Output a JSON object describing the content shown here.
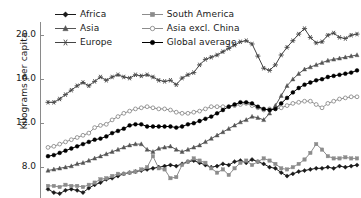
{
  "chart_data": {
    "type": "line",
    "title": "",
    "subtitle": "",
    "xlabel": "",
    "ylabel": "Kilograms per capita",
    "ylim": [
      5.2,
      21.2
    ],
    "yticks": [
      8.0,
      12.0,
      16.0,
      20.0
    ],
    "ytick_labels": [
      "8.0",
      "12.0",
      "16.0",
      "20.0"
    ],
    "grid": false,
    "legend_position": "top-left",
    "legend_columns": 2,
    "x": [
      1,
      2,
      3,
      4,
      5,
      6,
      7,
      8,
      9,
      10,
      11,
      12,
      13,
      14,
      15,
      16,
      17,
      18,
      19,
      20,
      21,
      22,
      23,
      24,
      25,
      26,
      27,
      28,
      29,
      30,
      31,
      32,
      33,
      34,
      35,
      36,
      37,
      38,
      39,
      40,
      41,
      42,
      43,
      44,
      45,
      46,
      47,
      48,
      49,
      50,
      51,
      52,
      53,
      54
    ],
    "series": [
      {
        "name": "Africa",
        "color": "#1a1a1a",
        "marker": "diamond",
        "values": [
          6.0,
          5.7,
          5.6,
          5.9,
          6.0,
          5.9,
          5.7,
          6.1,
          6.4,
          6.6,
          6.9,
          7.0,
          7.2,
          7.4,
          7.5,
          7.6,
          7.7,
          7.8,
          7.9,
          8.0,
          8.1,
          8.2,
          8.1,
          8.3,
          8.5,
          8.6,
          8.4,
          8.2,
          8.0,
          8.1,
          8.3,
          8.2,
          8.5,
          8.6,
          8.4,
          8.7,
          8.5,
          8.3,
          8.0,
          7.9,
          7.5,
          7.2,
          7.4,
          7.6,
          7.7,
          7.8,
          7.9,
          7.9,
          8.0,
          7.9,
          8.1,
          8.0,
          8.1,
          8.2
        ]
      },
      {
        "name": "Asia",
        "color": "#555555",
        "marker": "triangle",
        "values": [
          7.7,
          7.8,
          7.9,
          8.0,
          8.1,
          8.3,
          8.4,
          8.6,
          8.8,
          9.0,
          9.2,
          9.4,
          9.6,
          9.8,
          10.0,
          10.1,
          10.1,
          9.6,
          9.4,
          9.7,
          9.8,
          9.9,
          9.6,
          9.4,
          9.6,
          9.8,
          10.0,
          10.3,
          10.6,
          10.9,
          11.2,
          11.5,
          11.8,
          12.1,
          12.3,
          12.6,
          12.5,
          12.3,
          12.9,
          13.6,
          14.5,
          15.4,
          16.0,
          16.5,
          16.9,
          17.1,
          17.3,
          17.5,
          17.7,
          17.8,
          17.9,
          18.0,
          18.1,
          18.2
        ]
      },
      {
        "name": "Europe",
        "color": "#444444",
        "marker": "star",
        "values": [
          13.9,
          13.9,
          14.2,
          14.6,
          15.0,
          15.4,
          15.7,
          15.4,
          15.8,
          16.2,
          15.9,
          16.2,
          16.4,
          16.2,
          16.1,
          16.4,
          16.3,
          16.4,
          16.2,
          15.9,
          15.8,
          15.9,
          15.5,
          16.1,
          16.4,
          16.6,
          17.3,
          17.8,
          18.0,
          18.2,
          18.5,
          18.8,
          19.1,
          19.4,
          19.5,
          19.2,
          18.1,
          17.0,
          16.8,
          17.3,
          18.2,
          18.9,
          19.5,
          20.1,
          20.6,
          19.8,
          19.3,
          19.4,
          20.0,
          20.2,
          19.8,
          19.7,
          20.0,
          20.1
        ]
      },
      {
        "name": "South America",
        "color": "#8c8c8c",
        "marker": "square",
        "values": [
          6.3,
          6.3,
          6.2,
          6.4,
          6.3,
          6.3,
          6.2,
          6.4,
          6.6,
          6.9,
          7.0,
          7.2,
          7.4,
          7.4,
          7.5,
          7.6,
          7.8,
          8.0,
          9.0,
          7.9,
          7.8,
          7.0,
          7.1,
          8.2,
          8.5,
          8.8,
          8.6,
          8.4,
          7.9,
          7.5,
          7.8,
          7.3,
          7.9,
          8.4,
          8.6,
          8.2,
          8.5,
          8.8,
          8.6,
          8.3,
          7.9,
          7.8,
          8.0,
          8.3,
          8.7,
          9.3,
          10.1,
          9.6,
          9.0,
          8.8,
          8.8,
          8.9,
          8.8,
          8.8
        ]
      },
      {
        "name": "Asia excl. China",
        "color": "#8c8c8c",
        "marker": "circle-open",
        "values": [
          9.8,
          9.9,
          10.1,
          10.3,
          10.5,
          10.7,
          10.9,
          11.1,
          11.6,
          11.8,
          11.9,
          12.3,
          12.6,
          12.9,
          13.1,
          13.3,
          13.4,
          13.5,
          13.4,
          13.3,
          13.3,
          13.2,
          13.0,
          12.9,
          12.9,
          13.0,
          13.1,
          13.3,
          13.5,
          13.5,
          13.5,
          13.5,
          13.6,
          13.7,
          13.8,
          13.6,
          13.4,
          13.2,
          13.3,
          13.3,
          13.4,
          13.6,
          13.8,
          13.9,
          14.0,
          14.0,
          13.7,
          13.4,
          13.8,
          14.0,
          14.2,
          14.3,
          14.4,
          14.4
        ]
      },
      {
        "name": "Global average",
        "color": "#000000",
        "marker": "circle",
        "values": [
          9.0,
          9.1,
          9.3,
          9.5,
          9.7,
          9.9,
          10.1,
          10.3,
          10.5,
          10.6,
          10.8,
          11.1,
          11.3,
          11.5,
          11.8,
          11.9,
          11.9,
          11.7,
          11.7,
          11.7,
          11.7,
          11.7,
          11.6,
          11.7,
          11.9,
          12.0,
          12.2,
          12.4,
          12.6,
          12.9,
          13.2,
          13.5,
          13.7,
          13.9,
          13.9,
          13.8,
          13.5,
          13.3,
          13.2,
          13.3,
          13.8,
          14.3,
          14.8,
          15.2,
          15.5,
          15.7,
          15.9,
          16.0,
          16.2,
          16.3,
          16.4,
          16.5,
          16.6,
          16.8
        ]
      }
    ]
  },
  "legend": {
    "items": [
      {
        "label": "Africa",
        "key": "africa"
      },
      {
        "label": "South America",
        "key": "south-america"
      },
      {
        "label": "Asia",
        "key": "asia"
      },
      {
        "label": "Asia excl. China",
        "key": "asia-excl-china"
      },
      {
        "label": "Europe",
        "key": "europe"
      },
      {
        "label": "Global average",
        "key": "global-average"
      }
    ]
  },
  "axis": {
    "y_title": "Kilograms per capita",
    "y_tick_0": "8.0",
    "y_tick_1": "12.0",
    "y_tick_2": "16.0",
    "y_tick_3": "20.0"
  }
}
